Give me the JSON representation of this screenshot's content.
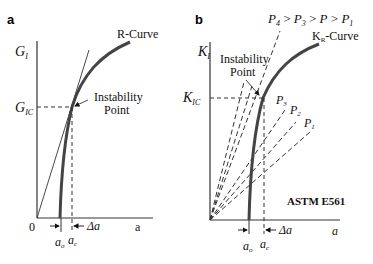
{
  "panel_a": {
    "label": "a",
    "y_axis_label": "G",
    "y_axis_sub": "I",
    "critical_label": "G",
    "critical_sub": "IC",
    "curve_label": "R-Curve",
    "instability_line1": "Instability",
    "instability_line2": "Point",
    "origin_label": "0",
    "x_axis_label": "a",
    "a0_label": "a",
    "a0_sub": "o",
    "ac_label": "a",
    "ac_sub": "c",
    "delta_label": "Δa"
  },
  "panel_b": {
    "label": "b",
    "y_axis_label": "K",
    "y_axis_sub": "I",
    "critical_label": "K",
    "critical_sub": "IC",
    "curve_label_main": "K",
    "curve_label_sub": "R",
    "curve_label_suffix": "-Curve",
    "load_order": [
      "P4",
      "P3",
      "P",
      "P1"
    ],
    "load_order_text": {
      "p4": "P",
      "p4s": "4",
      "p3": "P",
      "p3s": "3",
      "p": "P",
      "p1": "P",
      "p1s": "1",
      "gt": ">"
    },
    "load_lines": [
      {
        "label": "P",
        "sub": "3"
      },
      {
        "label": "P",
        "sub": "2"
      },
      {
        "label": "P",
        "sub": "1"
      }
    ],
    "instability_line1": "Instability",
    "instability_line2": "Point",
    "standard_label": "ASTM E561",
    "x_axis_label": "a",
    "a0_label": "a",
    "a0_sub": "o",
    "ac_label": "a",
    "ac_sub": "c",
    "delta_label": "Δa"
  }
}
